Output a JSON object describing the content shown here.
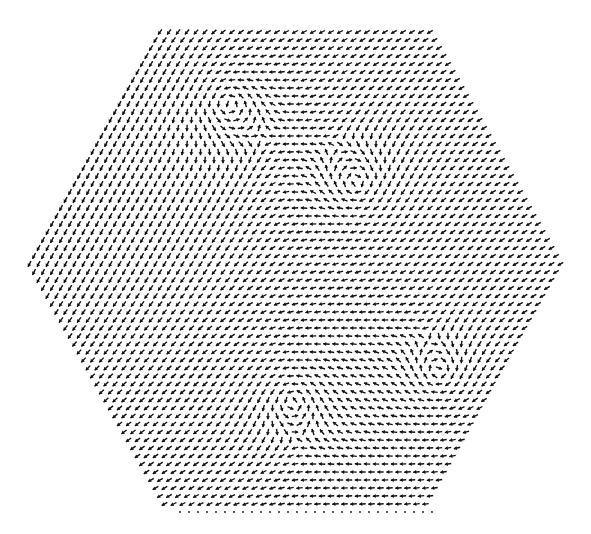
{
  "chart_data": {
    "type": "quiver",
    "title": "",
    "xlabel": "",
    "ylabel": "",
    "domain_shape": "hexagon",
    "grid": "triangular lattice of arrows",
    "arrow_color": "#111111",
    "background": "#ffffff",
    "vortices": [
      {
        "name": "upper-left-vortex",
        "center": [
          0.37,
          0.16
        ],
        "circulation": "counterclockwise",
        "strength": 1.0
      },
      {
        "name": "upper-right-vortex",
        "center": [
          0.61,
          0.33
        ],
        "circulation": "clockwise",
        "strength": 1.0
      },
      {
        "name": "lower-middle-vortex",
        "center": [
          0.49,
          0.77
        ],
        "circulation": "counterclockwise",
        "strength": 1.0
      },
      {
        "name": "lower-right-vortex",
        "center": [
          0.76,
          0.72
        ],
        "circulation": "clockwise",
        "strength": 1.0
      }
    ],
    "background_flow": [
      {
        "region": "left",
        "direction_deg": 250
      },
      {
        "region": "bottom",
        "direction_deg": 180
      },
      {
        "region": "right",
        "direction_deg": 200
      }
    ]
  }
}
